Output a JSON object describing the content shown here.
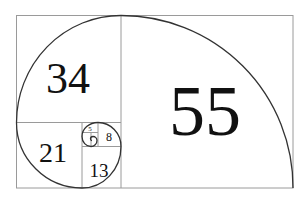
{
  "diagram": {
    "type": "fibonacci-spiral",
    "colors": {
      "background": "#ffffff",
      "grid_line": "#9a9a9a",
      "spiral": "#333333",
      "label": "#111111"
    },
    "squares": [
      {
        "id": "sq55",
        "label": "55"
      },
      {
        "id": "sq34",
        "label": "34"
      },
      {
        "id": "sq21",
        "label": "21"
      },
      {
        "id": "sq13",
        "label": "13"
      },
      {
        "id": "sq8",
        "label": "8"
      },
      {
        "id": "sq5",
        "label": "5"
      }
    ]
  }
}
